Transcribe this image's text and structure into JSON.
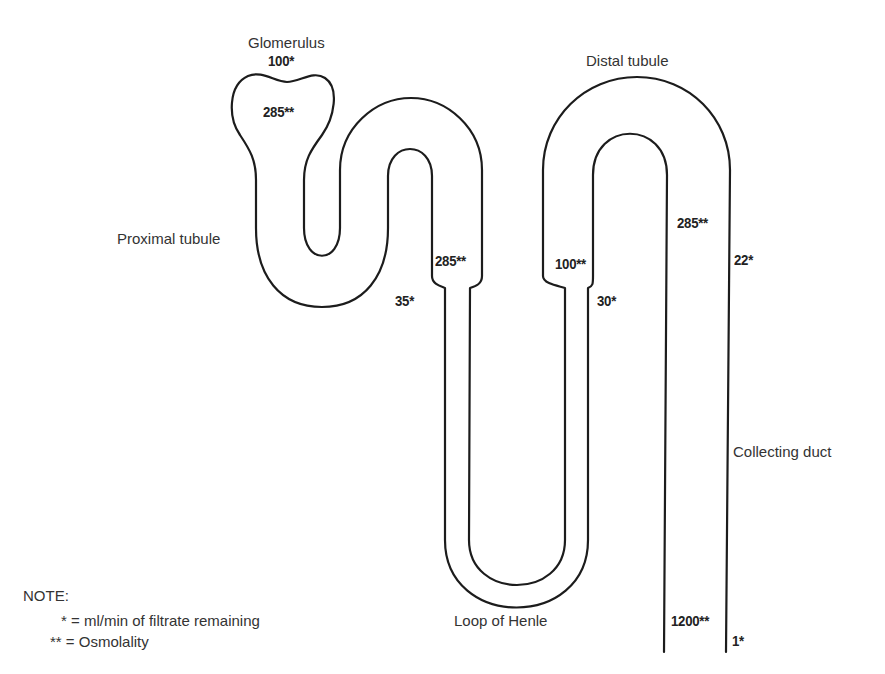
{
  "labels": {
    "glomerulus": "Glomerulus",
    "proximal_tubule": "Proximal tubule",
    "distal_tubule": "Distal tubule",
    "loop_of_henle": "Loop of Henle",
    "collecting_duct": "Collecting duct"
  },
  "values": {
    "glomerulus_filtrate": "100*",
    "glomerulus_osmolality": "285**",
    "proximal_end_osmolality": "285**",
    "proximal_end_filtrate": "35*",
    "ascending_end_osmolality": "100**",
    "ascending_end_filtrate": "30*",
    "distal_end_osmolality": "285**",
    "distal_end_filtrate": "22*",
    "duct_end_osmolality": "1200**",
    "duct_end_filtrate": "1*"
  },
  "note": {
    "title": "NOTE:",
    "lines": [
      "* = ml/min of filtrate remaining",
      "** = Osmolality"
    ]
  },
  "colors": {
    "stroke": "#1c1c1c",
    "text": "#333333",
    "background": "#ffffff"
  }
}
